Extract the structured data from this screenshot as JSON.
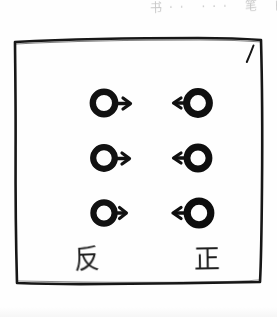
{
  "page": {
    "kind": "hand-drawn-scanned-figure",
    "background_color": "#fefefe",
    "ink_color": "#141414",
    "top_margin_note": "书·· ··· 笔 的"
  },
  "frame": {
    "label": "hand-drawn-rectangle",
    "corner_tick": "/",
    "stroke_color": "#171717"
  },
  "diagram": {
    "rows": [
      {
        "index": 1,
        "left": {
          "symbol": "circle-arrow-right",
          "direction": "right"
        },
        "right": {
          "symbol": "circle-arrow-left",
          "direction": "left"
        }
      },
      {
        "index": 2,
        "left": {
          "symbol": "circle-arrow-right",
          "direction": "right"
        },
        "right": {
          "symbol": "circle-arrow-left",
          "direction": "left"
        }
      },
      {
        "index": 3,
        "left": {
          "symbol": "circle-arrow-right",
          "direction": "right"
        },
        "right": {
          "symbol": "circle-arrow-left",
          "direction": "left"
        }
      }
    ]
  },
  "captions": {
    "left_label": "反",
    "right_label": "正"
  }
}
